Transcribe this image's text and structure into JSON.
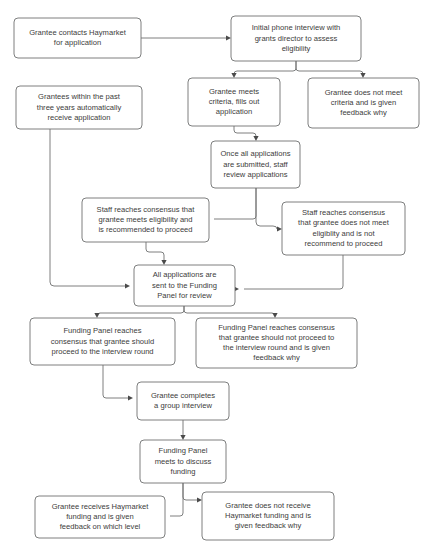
{
  "diagram": {
    "type": "flowchart",
    "canvas": {
      "width": 428,
      "height": 553
    },
    "style": {
      "box_fill": "#ffffff",
      "box_stroke": "#6f7071",
      "text_color": "#3c3c3b",
      "line_color": "#6f7071",
      "arrow_color": "#4a4a4a",
      "background": "#ffffff"
    },
    "nodes": [
      {
        "id": "n1",
        "name": "grantee-contacts-haymarket",
        "lines": [
          "Grantee contacts Haymarket",
          "for application"
        ],
        "x": 14,
        "y": 18,
        "w": 127,
        "h": 40
      },
      {
        "id": "n2",
        "name": "initial-phone-interview",
        "lines": [
          "Initial phone interview with",
          "grants director to assess",
          "eligibility"
        ],
        "x": 231,
        "y": 16,
        "w": 130,
        "h": 45
      },
      {
        "id": "n3",
        "name": "grantees-within-past-three-years",
        "lines": [
          "Grantees within the past",
          "three years automatically",
          "receive application"
        ],
        "x": 16,
        "y": 86,
        "w": 126,
        "h": 43
      },
      {
        "id": "n4",
        "name": "grantee-meets-criteria",
        "lines": [
          "Grantee meets",
          "criteria, fills out",
          "application"
        ],
        "x": 188,
        "y": 78,
        "w": 92,
        "h": 48
      },
      {
        "id": "n5",
        "name": "grantee-does-not-meet-criteria",
        "lines": [
          "Grantee does not meet",
          "criteria and is given",
          "feedback why"
        ],
        "x": 308,
        "y": 78,
        "w": 111,
        "h": 50
      },
      {
        "id": "n6",
        "name": "once-all-applications-submitted",
        "lines": [
          "Once all applications",
          "are submitted, staff",
          "review applications"
        ],
        "x": 211,
        "y": 141,
        "w": 89,
        "h": 47
      },
      {
        "id": "n7",
        "name": "staff-consensus-meets-eligibility",
        "lines": [
          "Staff reaches consensus that",
          "grantee meets eligibility and",
          "is recommended to proceed"
        ],
        "x": 82,
        "y": 198,
        "w": 127,
        "h": 44
      },
      {
        "id": "n8",
        "name": "staff-consensus-does-not-meet-eligibility",
        "lines": [
          "Staff reaches consensus",
          "that grantee does not meet",
          "eligiblity and is not",
          "recommend to proceed"
        ],
        "x": 282,
        "y": 202,
        "w": 123,
        "h": 53
      },
      {
        "id": "n9",
        "name": "all-applications-sent-to-funding-panel",
        "lines": [
          "All applications are",
          "sent to the Funding",
          "Panel for review"
        ],
        "x": 134,
        "y": 265,
        "w": 101,
        "h": 41
      },
      {
        "id": "n10",
        "name": "funding-panel-consensus-proceed",
        "lines": [
          "Funding Panel reaches",
          "consensus that grantee should",
          "proceed to the interview round"
        ],
        "x": 30,
        "y": 318,
        "w": 145,
        "h": 47
      },
      {
        "id": "n11",
        "name": "funding-panel-consensus-not-proceed",
        "lines": [
          "Funding Panel reaches consensus",
          "that grantee should not proceed to",
          "the interview round and is given",
          "feedback why"
        ],
        "x": 196,
        "y": 318,
        "w": 161,
        "h": 50
      },
      {
        "id": "n12",
        "name": "grantee-completes-group-interview",
        "lines": [
          "Grantee completes",
          "a group interview"
        ],
        "x": 137,
        "y": 382,
        "w": 92,
        "h": 38
      },
      {
        "id": "n13",
        "name": "funding-panel-meets-discuss-funding",
        "lines": [
          "Funding Panel",
          "meets to discuss",
          "funding"
        ],
        "x": 140,
        "y": 440,
        "w": 86,
        "h": 43
      },
      {
        "id": "n14",
        "name": "grantee-receives-funding",
        "lines": [
          "Grantee receives Haymarket",
          "funding and is given",
          "feedback on which level"
        ],
        "x": 35,
        "y": 496,
        "w": 130,
        "h": 42
      },
      {
        "id": "n15",
        "name": "grantee-does-not-receive-funding",
        "lines": [
          "Grantee does not receive",
          "Haymarket funding and is",
          "given feedback why"
        ],
        "x": 202,
        "y": 492,
        "w": 132,
        "h": 48
      }
    ],
    "edges": [
      {
        "id": "e1",
        "name": "edge-contacts-to-interview",
        "from": "n1",
        "to": "n2",
        "path": "M 141 38 L 226 38",
        "arrow": {
          "x": 231,
          "y": 38,
          "dir": "right"
        }
      },
      {
        "id": "e2",
        "name": "edge-interview-to-meets-criteria",
        "from": "n2",
        "to": "n4",
        "path": "M 296 61 L 296 68 Q 296 71 293 71 L 237 71 Q 234 71 234 74 L 234 73",
        "arrow": {
          "x": 234,
          "y": 78,
          "dir": "down"
        }
      },
      {
        "id": "e3",
        "name": "edge-interview-to-does-not-meet",
        "from": "n2",
        "to": "n5",
        "path": "M 296 61 L 296 68 Q 296 71 299 71 L 360 71 Q 363 71 363 74 L 363 73",
        "arrow": {
          "x": 363,
          "y": 78,
          "dir": "down"
        }
      },
      {
        "id": "e4",
        "name": "edge-meets-criteria-to-review",
        "from": "n4",
        "to": "n6",
        "path": "M 234 126 L 234 130 Q 234 133 237 133 L 253 133 Q 256 133 256 136 L 256 136",
        "arrow": {
          "x": 256,
          "y": 141,
          "dir": "down"
        }
      },
      {
        "id": "e5",
        "name": "edge-review-to-staff-consensus-yes",
        "from": "n6",
        "to": "n7",
        "path": "M 256 188 L 256 216 Q 256 219 253 219 L 214 219",
        "arrow": {
          "x": 209,
          "y": 219,
          "dir": "right"
        }
      },
      {
        "id": "e6",
        "name": "edge-review-to-staff-consensus-no",
        "from": "n6",
        "to": "n8",
        "path": "M 256 188 L 256 222 Q 256 226 260 226 L 273 226 Q 277 226 277 229 L 277 229",
        "arrow": {
          "x": 282,
          "y": 229,
          "dir": "right"
        }
      },
      {
        "id": "e7",
        "name": "edge-staff-yes-to-all-applications",
        "from": "n7",
        "to": "n9",
        "path": "M 146 242 L 146 249 Q 146 252 149 252 L 161 252 Q 164 252 164 255 L 164 260",
        "arrow": {
          "x": 164,
          "y": 265,
          "dir": "down"
        }
      },
      {
        "id": "e8",
        "name": "edge-grantees-past-to-all-applications",
        "from": "n3",
        "to": "n9",
        "path": "M 50 129 L 50 282 Q 50 286 54 286 L 125 286",
        "arrow": {
          "x": 130,
          "y": 286,
          "dir": "right"
        }
      },
      {
        "id": "e9",
        "name": "edge-staff-no-to-all-applications",
        "from": "n8",
        "to": "n9",
        "path": "M 343 255 L 343 286 Q 343 289 340 289 L 244 289",
        "arrow": {
          "x": 239,
          "y": 289,
          "dir": "right"
        }
      },
      {
        "id": "e10",
        "name": "edge-all-applications-to-panel-proceed",
        "from": "n9",
        "to": "n10",
        "path": "M 184 306 L 184 310 Q 184 313 181 313 L 100 313 Q 97 313 97 316 L 97 314",
        "arrow": {
          "x": 97,
          "y": 318,
          "dir": "down"
        }
      },
      {
        "id": "e11",
        "name": "edge-all-applications-to-panel-not-proceed",
        "from": "n9",
        "to": "n11",
        "path": "M 184 306 L 184 310 Q 184 313 187 313 L 272 313 Q 275 313 275 316 L 275 314",
        "arrow": {
          "x": 275,
          "y": 318,
          "dir": "down"
        }
      },
      {
        "id": "e12",
        "name": "edge-panel-proceed-to-group-interview",
        "from": "n10",
        "to": "n12",
        "path": "M 103 365 L 103 395 Q 103 398 106 398 L 128 398",
        "arrow": {
          "x": 133,
          "y": 398,
          "dir": "right"
        }
      },
      {
        "id": "e13",
        "name": "edge-group-interview-to-panel-meets",
        "from": "n12",
        "to": "n13",
        "path": "M 183 420 L 183 435",
        "arrow": {
          "x": 183,
          "y": 440,
          "dir": "down"
        }
      },
      {
        "id": "e14",
        "name": "edge-panel-meets-to-receives-funding",
        "from": "n13",
        "to": "n14",
        "path": "M 183 483 L 183 513 Q 183 516 180 516 L 170 516",
        "arrow": {
          "x": 165,
          "y": 516,
          "dir": "right"
        }
      },
      {
        "id": "e15",
        "name": "edge-panel-meets-to-not-receive-funding",
        "from": "n13",
        "to": "n15",
        "path": "M 183 483 L 183 497 Q 183 500 186 500 L 197 500",
        "arrow": {
          "x": 202,
          "y": 500,
          "dir": "right"
        }
      }
    ]
  }
}
